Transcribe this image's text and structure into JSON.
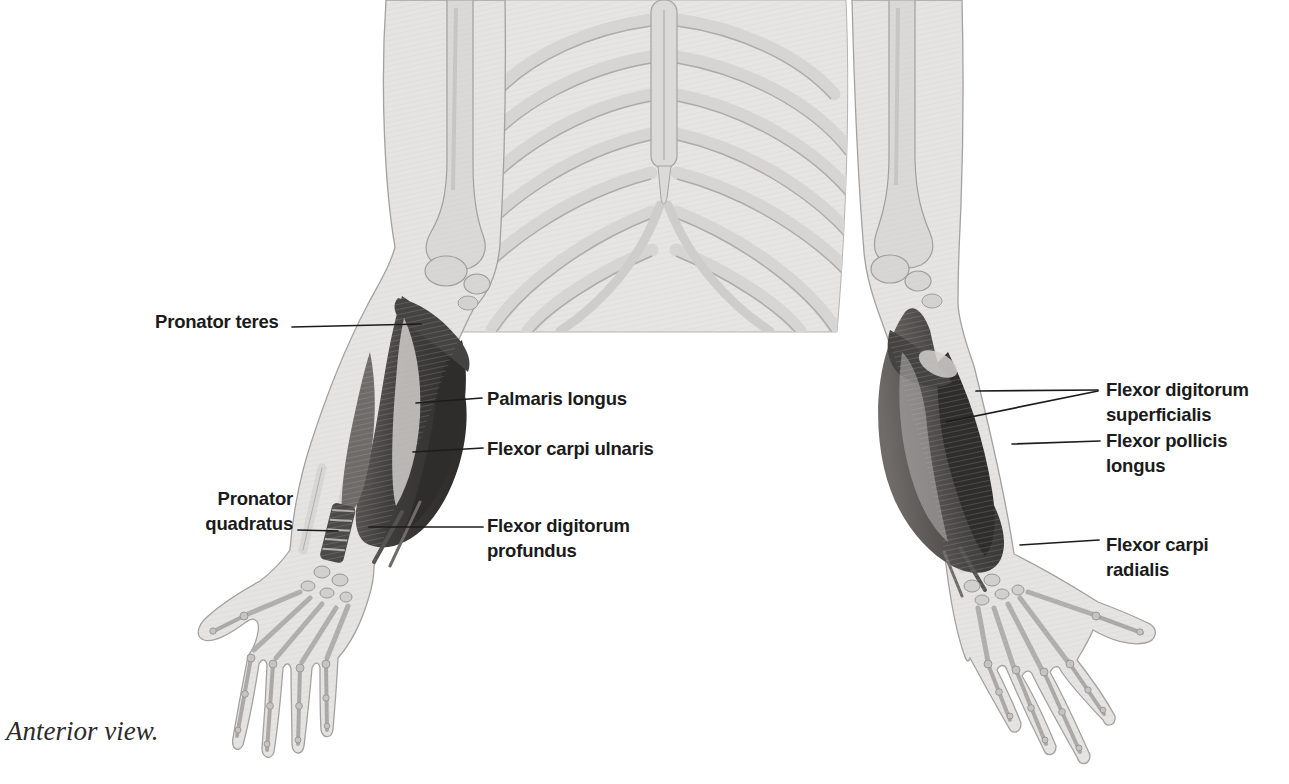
{
  "figure": {
    "caption": "Anterior view.",
    "labels": [
      {
        "id": "pronator-teres",
        "text": "Pronator teres",
        "side": "left"
      },
      {
        "id": "palmaris-longus",
        "text": "Palmaris longus",
        "side": "left"
      },
      {
        "id": "flexor-carpi-ulnaris",
        "text": "Flexor carpi ulnaris",
        "side": "left"
      },
      {
        "id": "pronator-quadratus",
        "text": "Pronator quadratus",
        "side": "left"
      },
      {
        "id": "flexor-digitorum-profundus",
        "text": "Flexor digitorum profundus",
        "side": "left"
      },
      {
        "id": "flexor-digitorum-superficialis",
        "text": "Flexor digitorum superficialis",
        "side": "right"
      },
      {
        "id": "flexor-pollicis-longus",
        "text": "Flexor pollicis longus",
        "side": "right"
      },
      {
        "id": "flexor-carpi-radialis",
        "text": "Flexor carpi radialis",
        "side": "right"
      }
    ],
    "palette": {
      "background": "#ffffff",
      "skin": "#e6e4e2",
      "bone": "#dbd9d7",
      "outline": "#a09e9c",
      "muscle_dark": "#3a3836",
      "muscle_mid": "#565350",
      "muscle_highlight": "#cfccc9",
      "label_text": "#1b1b1b"
    }
  }
}
